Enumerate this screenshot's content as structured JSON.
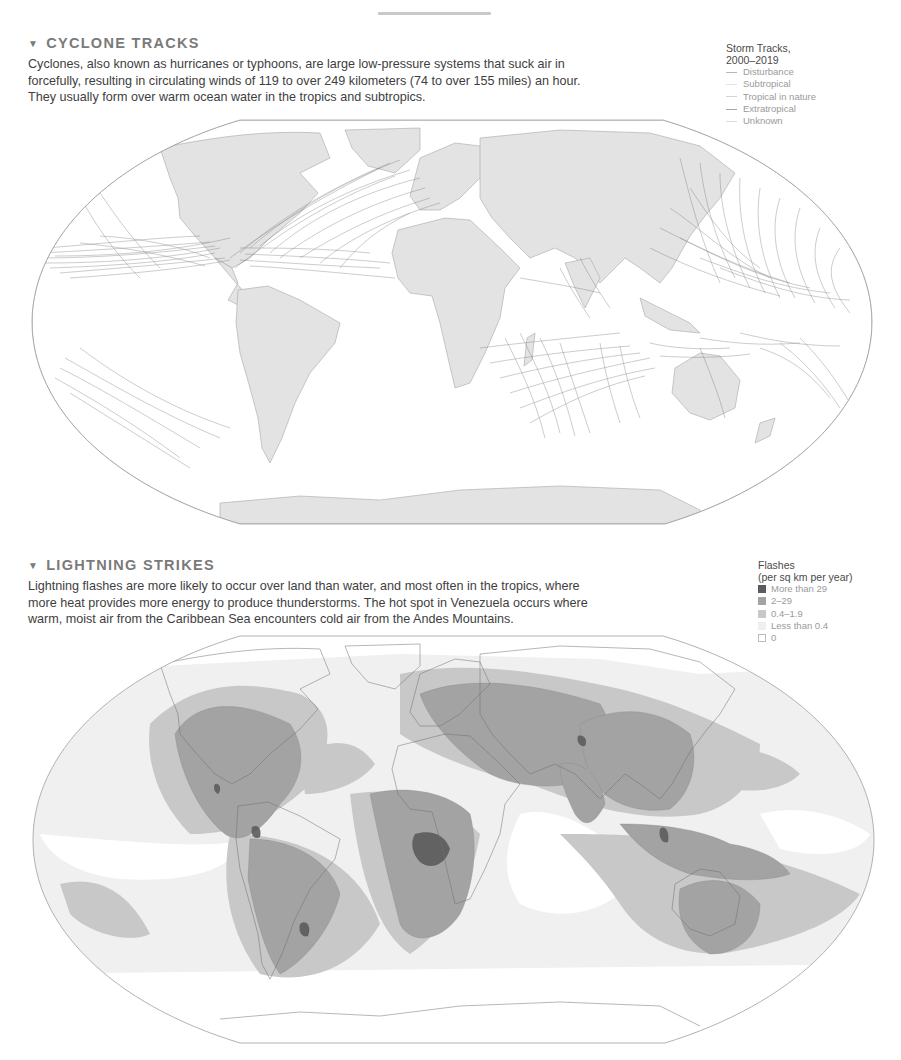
{
  "page": {
    "top_bar": "decorative-separator"
  },
  "cyclone": {
    "heading_icon": "▼",
    "heading": "CYCLONE TRACKS",
    "body": "Cyclones, also known as hurricanes or typhoons, are large low-pressure systems that suck air in forcefully, resulting in circulating winds of 119 to over 249 kilometers (74 to over 155 miles) an hour. They usually form over warm ocean water in the tropics and subtropics.",
    "legend": {
      "title_line1": "Storm Tracks,",
      "title_line2": "2000–2019",
      "items": [
        {
          "label": "Disturbance",
          "color": "#b5b5b5"
        },
        {
          "label": "Subtropical",
          "color": "#e2e2e2"
        },
        {
          "label": "Tropical in nature",
          "color": "#d4d4d4"
        },
        {
          "label": "Extratropical",
          "color": "#a8a8a8"
        },
        {
          "label": "Unknown",
          "color": "#dcdcdc"
        }
      ]
    },
    "map": {
      "land_color": "#e3e3e3",
      "border_color": "#9a9a9a",
      "track_color": "#6a6a6a"
    }
  },
  "lightning": {
    "heading_icon": "▼",
    "heading": "LIGHTNING STRIKES",
    "body": "Lightning flashes are more likely to occur over land than water, and most often in the tropics, where more heat provides more energy to produce thunderstorms. The hot spot in Venezuela occurs where warm, moist air from the Caribbean Sea encounters cold air from the Andes Mountains.",
    "legend": {
      "title_line1": "Flashes",
      "title_line2": "(per sq km per year)",
      "items": [
        {
          "label": "More than 29",
          "color": "#5c5c5c"
        },
        {
          "label": "2–29",
          "color": "#a3a3a3"
        },
        {
          "label": "0.4–1.9",
          "color": "#c8c8c8"
        },
        {
          "label": "Less than 0.4",
          "color": "#efefef"
        },
        {
          "label": "0",
          "color": "#ffffff"
        }
      ]
    }
  }
}
